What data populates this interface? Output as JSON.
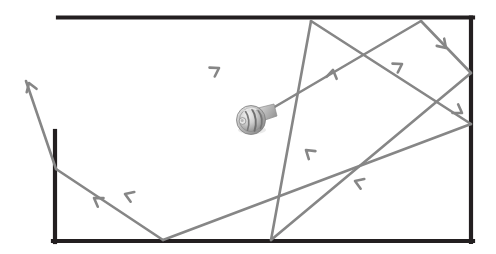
{
  "diagram": {
    "type": "coverage-path-diagram",
    "canvas": {
      "width": 496,
      "height": 254,
      "background": "#ffffff"
    },
    "room": {
      "name": "room-boundary",
      "color": "#231f20",
      "stroke_width": 4.2,
      "walls": [
        {
          "name": "top-wall",
          "x1": 58,
          "y1": 17.5,
          "x2": 473,
          "y2": 17.5
        },
        {
          "name": "right-wall",
          "x1": 471,
          "y1": 17.5,
          "x2": 471,
          "y2": 242
        },
        {
          "name": "bottom-wall",
          "x1": 53,
          "y1": 241,
          "x2": 473,
          "y2": 241
        },
        {
          "name": "left-wall",
          "x1": 55,
          "y1": 131,
          "x2": 55,
          "y2": 242
        }
      ]
    },
    "path": {
      "name": "boustrophedon-sweep-path",
      "color": "#868686",
      "stroke_width": 2.6,
      "start_label": "robot",
      "segments": [
        {
          "name": "segment-outbound-1",
          "x1": 266,
          "y1": 112,
          "x2": 421,
          "y2": 21,
          "direction": "up-right"
        },
        {
          "name": "segment-turn-1",
          "x1": 421,
          "y1": 21,
          "x2": 471,
          "y2": 73,
          "direction": "down-right"
        },
        {
          "name": "segment-return-1",
          "x1": 471,
          "y1": 73,
          "x2": 271,
          "y2": 240,
          "direction": "down-left"
        },
        {
          "name": "segment-turn-2",
          "x1": 271,
          "y1": 240,
          "x2": 311,
          "y2": 21,
          "direction": "up-right-long"
        },
        {
          "name": "segment-outbound-2",
          "x1": 311,
          "y1": 21,
          "x2": 471,
          "y2": 124,
          "direction": "down-right"
        },
        {
          "name": "segment-return-2",
          "x1": 471,
          "y1": 124,
          "x2": 163,
          "y2": 240,
          "direction": "down-left"
        },
        {
          "name": "segment-turn-3",
          "x1": 163,
          "y1": 240,
          "x2": 56,
          "y2": 169,
          "direction": "up-left"
        },
        {
          "name": "segment-exit",
          "x1": 56,
          "y1": 169,
          "x2": 26,
          "y2": 81,
          "direction": "up-left"
        }
      ],
      "arrowheads": [
        {
          "name": "arrowhead-up-right-1",
          "x": 219,
          "y": 68,
          "angle": -30.5
        },
        {
          "name": "arrowhead-up-right-2",
          "x": 333,
          "y": 70,
          "angle": -79.5
        },
        {
          "name": "arrowhead-up-right-3",
          "x": 402,
          "y": 64,
          "angle": -30.5
        },
        {
          "name": "arrowhead-down-right-1",
          "x": 446,
          "y": 48,
          "angle": 46.0
        },
        {
          "name": "arrowhead-down-right-2",
          "x": 462,
          "y": 113,
          "angle": 32.8
        },
        {
          "name": "arrowhead-down-left-1",
          "x": 306,
          "y": 150,
          "angle": 219.8
        },
        {
          "name": "arrowhead-down-left-2",
          "x": 355,
          "y": 181,
          "angle": 200.6
        },
        {
          "name": "arrowhead-up-left-1",
          "x": 125,
          "y": 194,
          "angle": 200.6
        },
        {
          "name": "arrowhead-up-left-2",
          "x": 94,
          "y": 198,
          "angle": 213.5
        },
        {
          "name": "arrowhead-exit-tip",
          "x": 29,
          "y": 83,
          "angle": 251.0
        }
      ]
    },
    "robot": {
      "name": "robot-icon",
      "label": "robot",
      "x": 251,
      "y": 120,
      "radius": 15,
      "body_color": "#c9c9c9",
      "shade_color": "#8d8d8d",
      "highlight_color": "#efefef"
    }
  }
}
